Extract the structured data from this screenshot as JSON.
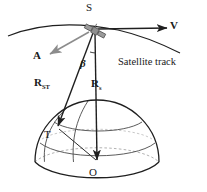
{
  "figure": {
    "type": "diagram",
    "width": 207,
    "height": 192
  },
  "labels": {
    "satellite_point": "S",
    "velocity_vector": "V",
    "attitude_vector": "A",
    "angle": "β",
    "range_vector_main": "R",
    "range_vector_main_sub": "ST",
    "radius_vector_main": "R",
    "radius_vector_main_sub": "s",
    "target_point": "T",
    "earth_center_point": "O",
    "track_caption": "Satellite track"
  },
  "icons": {
    "satellite": "satellite-icon"
  },
  "colors": {
    "ink": "#1a1a1a",
    "line": "#2b2b2b",
    "hidden_line": "#9a9a9a",
    "attitude_arrow": "#8c8c8c",
    "satellite_body": "#8a8a8a",
    "background": "#ffffff"
  },
  "geometry": {
    "satellite_xy": [
      95,
      31
    ],
    "target_xy": [
      57,
      128
    ],
    "center_xy": [
      97,
      162
    ],
    "velocity_arrow_tip": [
      168,
      28
    ],
    "attitude_arrow_tip": [
      49,
      55
    ],
    "globe_center_xy": [
      97,
      162
    ],
    "globe_radius": 62
  }
}
